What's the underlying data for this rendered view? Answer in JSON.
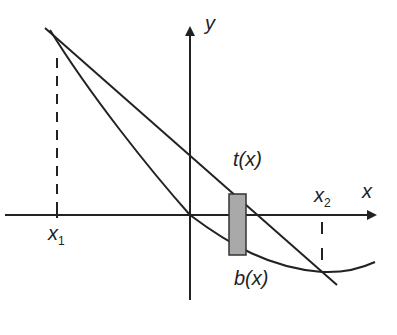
{
  "diagram": {
    "type": "area-between-curves",
    "axes": {
      "x_label": "x",
      "y_label": "y"
    },
    "curves": {
      "top": {
        "label": "t(x)",
        "shape": "straight line"
      },
      "bottom": {
        "label": "b(x)",
        "shape": "curve"
      }
    },
    "points": {
      "left_intersection": {
        "label": "x",
        "subscript": "1"
      },
      "right_intersection": {
        "label": "x",
        "subscript": "2"
      }
    },
    "strip": {
      "description": "representative rectangle",
      "fill": "#a9a9a9"
    },
    "colors": {
      "line": "#222222",
      "strip_fill": "#a9a9a9",
      "strip_stroke": "#333333"
    }
  }
}
